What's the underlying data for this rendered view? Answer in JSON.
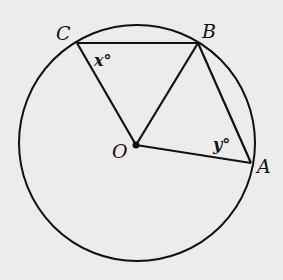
{
  "figure": {
    "type": "geometry",
    "background": "#ececec",
    "stroke": "#111111",
    "circle": {
      "center": "O",
      "cx": 137,
      "cy": 143,
      "r": 118
    },
    "points": {
      "C": {
        "label": "C",
        "x": 77,
        "y": 43
      },
      "B": {
        "label": "B",
        "x": 198,
        "y": 43
      },
      "O": {
        "label": "O",
        "x": 136,
        "y": 145
      },
      "A": {
        "label": "A",
        "x": 251,
        "y": 163
      }
    },
    "segments": [
      [
        "C",
        "B"
      ],
      [
        "C",
        "O"
      ],
      [
        "B",
        "O"
      ],
      [
        "B",
        "A"
      ],
      [
        "O",
        "A"
      ]
    ],
    "angles": {
      "x": {
        "label": "x°",
        "vertex": "C",
        "between": [
          "B",
          "O"
        ]
      },
      "y": {
        "label": "y°",
        "vertex": "A",
        "between": [
          "B",
          "O"
        ]
      }
    }
  }
}
